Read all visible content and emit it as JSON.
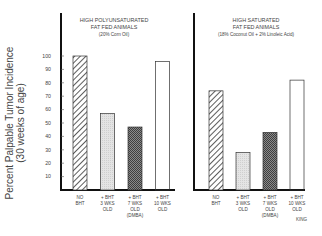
{
  "chart_data": [
    {
      "type": "bar",
      "title_lines": [
        "HIGH POLYUNSATURATED",
        "FAT FED ANIMALS",
        "(20% Corn Oil)"
      ],
      "categories": [
        [
          "NO",
          "BHT"
        ],
        [
          "+ BHT",
          "3 WKS",
          "OLD"
        ],
        [
          "+ BHT",
          "7 WKS",
          "OLD",
          "(DMBA)"
        ],
        [
          "+ BHT",
          "10 WKS",
          "OLD"
        ]
      ],
      "values": [
        100,
        57,
        47,
        96
      ],
      "patterns": [
        "hatch",
        "light-dots",
        "dark-crosshatch",
        "white"
      ],
      "ylabel_lines": [
        "Percent Palpable Tumor Incidence",
        "(30 weeks of age)"
      ],
      "yticks": [
        10,
        20,
        30,
        40,
        50,
        60,
        70,
        80,
        90,
        100
      ],
      "ylim": [
        0,
        100
      ],
      "grid": false
    },
    {
      "type": "bar",
      "title_lines": [
        "HIGH SATURATED",
        "FAT FED ANIMALS",
        "(18% Coconut Oil + 2% Linoleic Acid)"
      ],
      "categories": [
        [
          "NO",
          "BHT"
        ],
        [
          "+ BHT",
          "3 WKS",
          "OLD"
        ],
        [
          "+ BHT",
          "7 WKS",
          "OLD",
          "(DMBA)"
        ],
        [
          "+ BHT",
          "10 WKS",
          "OLD"
        ]
      ],
      "values": [
        74,
        28,
        43,
        82
      ],
      "patterns": [
        "hatch",
        "light-dots",
        "dark-crosshatch",
        "white"
      ],
      "ylim": [
        0,
        100
      ],
      "grid": false
    }
  ],
  "credit": "KING"
}
